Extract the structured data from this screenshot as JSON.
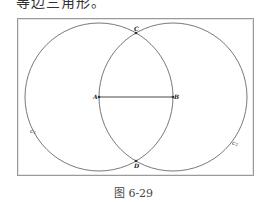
{
  "top_text": "等边三角形。",
  "figure": {
    "caption": "图 6-29",
    "points": {
      "A": {
        "label": "A",
        "x": 99,
        "y": 97
      },
      "B": {
        "label": "B",
        "x": 173,
        "y": 97
      },
      "C": {
        "label": "C",
        "x": 136,
        "y": 33
      },
      "D": {
        "label": "D",
        "x": 136,
        "y": 161
      }
    },
    "circles": [
      {
        "name": "c1",
        "label": "c",
        "subscript": "1",
        "center": "A",
        "radius": 74
      },
      {
        "name": "c2",
        "label": "c",
        "subscript": "2",
        "center": "B",
        "radius": 74
      }
    ],
    "segments": [
      {
        "from": "A",
        "to": "B"
      }
    ],
    "colors": {
      "stroke": "#555555",
      "frame": "#9a9a9a"
    }
  }
}
